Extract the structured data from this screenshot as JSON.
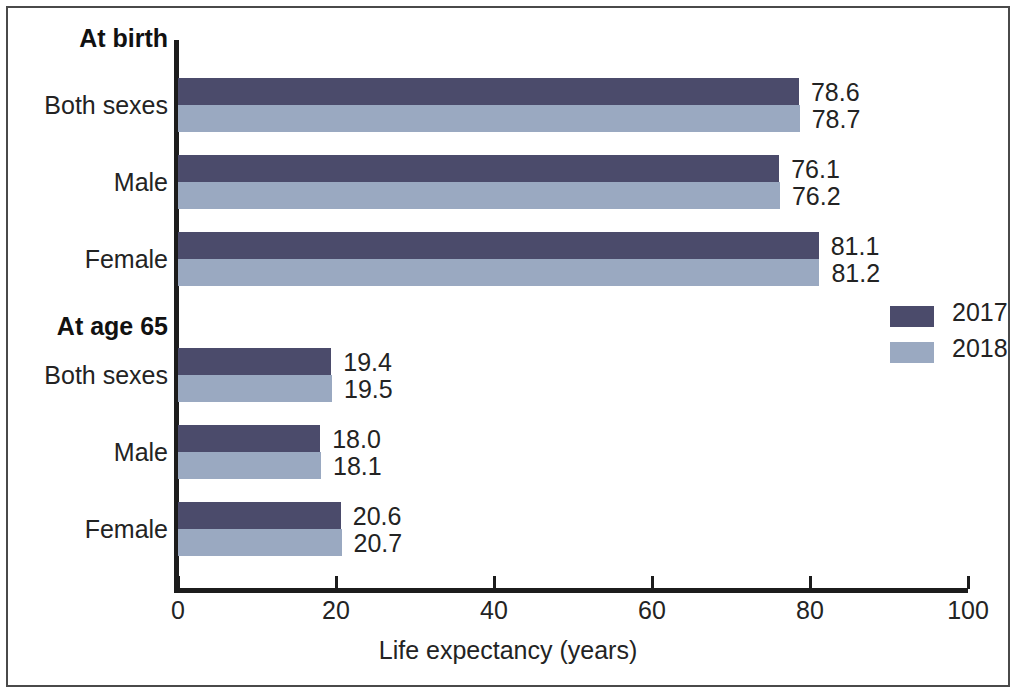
{
  "chart_data": {
    "type": "bar",
    "title": "",
    "orientation": "horizontal",
    "xlabel": "Life expectancy (years)",
    "ylabel": "",
    "xlim": [
      0,
      100
    ],
    "xticks": [
      0,
      20,
      40,
      60,
      80,
      100
    ],
    "xtick_labels": [
      "0",
      "20",
      "40",
      "60",
      "80",
      "100"
    ],
    "grid": false,
    "legend_position": "right-middle",
    "groups": [
      {
        "name": "At birth",
        "categories": [
          "Both sexes",
          "Male",
          "Female"
        ],
        "values_2017": [
          78.6,
          76.1,
          81.1
        ],
        "values_2018": [
          78.7,
          76.2,
          81.2
        ]
      },
      {
        "name": "At age 65",
        "categories": [
          "Both sexes",
          "Male",
          "Female"
        ],
        "values_2017": [
          19.4,
          18.0,
          20.6
        ],
        "values_2018": [
          19.5,
          18.1,
          20.7
        ]
      }
    ],
    "series": [
      {
        "name": "2017",
        "color": "#4b4b6b",
        "values": [
          78.6,
          76.1,
          81.1,
          19.4,
          18.0,
          20.6
        ]
      },
      {
        "name": "2018",
        "color": "#9aa9c1",
        "values": [
          78.7,
          76.2,
          81.2,
          19.5,
          18.1,
          20.7
        ]
      }
    ],
    "categories": [
      "At birth - Both sexes",
      "At birth - Male",
      "At birth - Female",
      "At age 65 - Both sexes",
      "At age 65 - Male",
      "At age 65 - Female"
    ]
  },
  "axis": {
    "x_title": "Life expectancy (years)",
    "ticks": [
      {
        "label": "0",
        "value": 0
      },
      {
        "label": "20",
        "value": 20
      },
      {
        "label": "40",
        "value": 40
      },
      {
        "label": "60",
        "value": 60
      },
      {
        "label": "80",
        "value": 80
      },
      {
        "label": "100",
        "value": 100
      }
    ]
  },
  "category_labels": [
    {
      "text": "At birth",
      "bold": true
    },
    {
      "text": "Both sexes",
      "bold": false
    },
    {
      "text": "Male",
      "bold": false
    },
    {
      "text": "Female",
      "bold": false
    },
    {
      "text": "At age 65",
      "bold": true
    },
    {
      "text": "Both sexes",
      "bold": false
    },
    {
      "text": "Male",
      "bold": false
    },
    {
      "text": "Female",
      "bold": false
    }
  ],
  "bars": [
    {
      "group": "At birth",
      "category": "Both sexes",
      "series": "2017",
      "value": 78.6,
      "label": "78.6"
    },
    {
      "group": "At birth",
      "category": "Both sexes",
      "series": "2018",
      "value": 78.7,
      "label": "78.7"
    },
    {
      "group": "At birth",
      "category": "Male",
      "series": "2017",
      "value": 76.1,
      "label": "76.1"
    },
    {
      "group": "At birth",
      "category": "Male",
      "series": "2018",
      "value": 76.2,
      "label": "76.2"
    },
    {
      "group": "At birth",
      "category": "Female",
      "series": "2017",
      "value": 81.1,
      "label": "81.1"
    },
    {
      "group": "At birth",
      "category": "Female",
      "series": "2018",
      "value": 81.2,
      "label": "81.2"
    },
    {
      "group": "At age 65",
      "category": "Both sexes",
      "series": "2017",
      "value": 19.4,
      "label": "19.4"
    },
    {
      "group": "At age 65",
      "category": "Both sexes",
      "series": "2018",
      "value": 19.5,
      "label": "19.5"
    },
    {
      "group": "At age 65",
      "category": "Male",
      "series": "2017",
      "value": 18.0,
      "label": "18.0"
    },
    {
      "group": "At age 65",
      "category": "Male",
      "series": "2018",
      "value": 18.1,
      "label": "18.1"
    },
    {
      "group": "At age 65",
      "category": "Female",
      "series": "2017",
      "value": 20.6,
      "label": "20.6"
    },
    {
      "group": "At age 65",
      "category": "Female",
      "series": "2018",
      "value": 20.7,
      "label": "20.7"
    }
  ],
  "legend": {
    "items": [
      {
        "label": "2017",
        "color": "#4b4b6b"
      },
      {
        "label": "2018",
        "color": "#9aa9c1"
      }
    ]
  },
  "colors": {
    "series_2017": "#4b4b6b",
    "series_2018": "#9aa9c1",
    "axis": "#1c1c1c",
    "text": "#232323",
    "background": "#ffffff",
    "frame": "#4a4a4a"
  }
}
